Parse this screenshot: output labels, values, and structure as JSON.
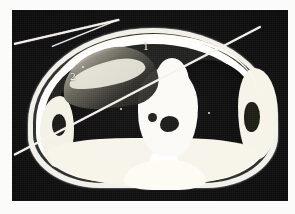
{
  "figure": {
    "modality": "CT",
    "view": "axial-chest-cross-section",
    "background_color": "#0b0b0b",
    "tissue_bright_color": "#f7f4ea",
    "lung_dark_color": "#070707",
    "margin_color": "#fbfbfa"
  },
  "annotations": {
    "markers": [
      {
        "id": "marker-1",
        "label": "1",
        "x": 131,
        "y": 31,
        "color": "#ffffff"
      },
      {
        "id": "marker-2",
        "label": "2",
        "x": 58,
        "y": 61,
        "color": "#ffffff"
      }
    ]
  },
  "overlay_lines": [
    {
      "id": "scratch-long",
      "label": "",
      "angle_deg": -27.5,
      "length_px": 278
    },
    {
      "id": "scratch-upper-a",
      "label": "",
      "angle_deg": -13,
      "length_px": 108
    },
    {
      "id": "scratch-upper-b",
      "label": "",
      "angle_deg": -22,
      "length_px": 70
    }
  ],
  "anatomy": {
    "regions": [
      {
        "name": "body-outline",
        "label": ""
      },
      {
        "name": "subcutaneous-fat",
        "label": ""
      },
      {
        "name": "chest-wall-muscle",
        "label": ""
      },
      {
        "name": "left-lung",
        "label": ""
      },
      {
        "name": "right-lung",
        "label": ""
      },
      {
        "name": "mediastinum",
        "label": ""
      },
      {
        "name": "spine",
        "label": ""
      },
      {
        "name": "left-pleural-thickening",
        "label": ""
      },
      {
        "name": "right-lateral-chest-wall",
        "label": ""
      }
    ]
  }
}
